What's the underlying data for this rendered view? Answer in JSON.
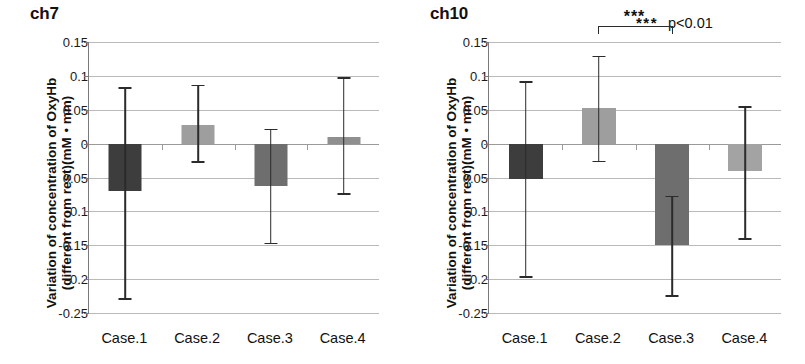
{
  "figure": {
    "width": 805,
    "height": 364,
    "background": "#ffffff"
  },
  "significance_legend": {
    "stars": "***",
    "pvalue": "p<0.01"
  },
  "axis": {
    "y_title_line1": "Variation of concentration of OxyHb",
    "y_title_line2": "(different from rest)(mM・mm)",
    "tick_labels": [
      "0.15",
      "0.1",
      "0.05",
      "0",
      "0.05",
      "-0.1",
      "-0.15",
      "-0.2",
      "-0.25"
    ],
    "tick_values": [
      0.15,
      0.1,
      0.05,
      0,
      -0.05,
      -0.1,
      -0.15,
      -0.2,
      -0.25
    ],
    "ymin": -0.25,
    "ymax": 0.15,
    "categories": [
      "Case.1",
      "Case.2",
      "Case.3",
      "Case.4"
    ]
  },
  "colors": {
    "bar_dark": "#3d3d3d",
    "bar_medium": "#6e6e6e",
    "bar_light": "#9e9e9e",
    "bar_lighter": "#a8a8a8",
    "gridline": "#b9b9b9",
    "axis": "#7a7a7a",
    "error": "#2b2b2b",
    "text": "#111111"
  },
  "chart_data": [
    {
      "type": "bar",
      "title": "ch7",
      "panel": "left",
      "xlabel": "",
      "ylabel": "Variation of concentration of OxyHb (different from rest)(mM・mm)",
      "ylim": [
        -0.25,
        0.15
      ],
      "yticks": [
        0.15,
        0.1,
        0.05,
        0,
        -0.05,
        -0.1,
        -0.15,
        -0.2,
        -0.25
      ],
      "grid": true,
      "legend": "none",
      "categories": [
        "Case.1",
        "Case.2",
        "Case.3",
        "Case.4"
      ],
      "values": [
        -0.07,
        0.028,
        -0.062,
        0.01
      ],
      "error_low": [
        -0.228,
        -0.026,
        -0.146,
        -0.073
      ],
      "error_high": [
        0.083,
        0.087,
        0.022,
        0.098
      ],
      "bar_colors": [
        "#3d3d3d",
        "#9e9e9e",
        "#6e6e6e",
        "#8f8f8f"
      ],
      "annotations": []
    },
    {
      "type": "bar",
      "title": "ch10",
      "panel": "right",
      "xlabel": "",
      "ylabel": "Variation of concentration of OxyHb (different from rest)(mM・mm)",
      "ylim": [
        -0.25,
        0.15
      ],
      "yticks": [
        0.15,
        0.1,
        0.05,
        0,
        -0.05,
        -0.1,
        -0.15,
        -0.2,
        -0.25
      ],
      "grid": true,
      "legend": "none",
      "categories": [
        "Case.1",
        "Case.2",
        "Case.3",
        "Case.4"
      ],
      "values": [
        -0.052,
        0.053,
        -0.15,
        -0.04
      ],
      "error_low": [
        -0.196,
        -0.025,
        -0.224,
        -0.14
      ],
      "error_high": [
        0.092,
        0.13,
        -0.077,
        0.055
      ],
      "bar_colors": [
        "#3d3d3d",
        "#9e9e9e",
        "#6e6e6e",
        "#a3a3a3"
      ],
      "annotations": [
        {
          "kind": "significance-bracket",
          "label": "***",
          "from_category": "Case.2",
          "to_category": "Case.3"
        }
      ]
    }
  ]
}
